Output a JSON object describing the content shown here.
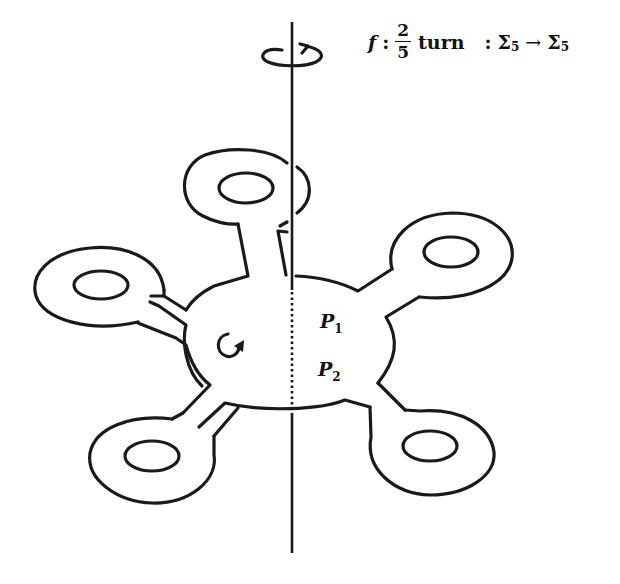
{
  "caption": {
    "map_name": "f",
    "colon": ":",
    "fraction_numerator": "2",
    "fraction_denominator": "5",
    "word": "turn",
    "colon2": ":",
    "domain_symbol": "Σ",
    "domain_subscript": "5",
    "arrow": "→",
    "codomain_symbol": "Σ",
    "codomain_subscript": "5"
  },
  "labels": {
    "p1": {
      "letter": "P",
      "subscript": "1"
    },
    "p2": {
      "letter": "P",
      "subscript": "2"
    }
  },
  "figure": {
    "handle_count": 5,
    "rotation_arrow_icon": "counterclockwise-rotation-arrow",
    "inner_rotation_icon": "circular-arrow",
    "stroke_color": "#1a1a1a",
    "background_color": "#ffffff"
  }
}
